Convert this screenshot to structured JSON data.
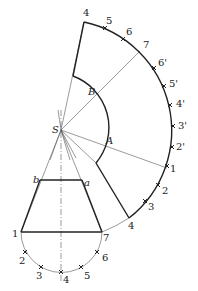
{
  "figure": {
    "apex_label": "S",
    "inner_arc_labels": [
      "A",
      "B"
    ],
    "frustum_top_labels": [
      "b",
      "a"
    ],
    "base_labels": [
      "1",
      "2",
      "3",
      "4",
      "5",
      "6",
      "7"
    ],
    "outer_arc_labels": [
      "1",
      "2",
      "3",
      "4",
      "2'",
      "3'",
      "4'",
      "5'",
      "6'",
      "7",
      "6",
      "5",
      "4"
    ],
    "colors": {
      "line": "#222222",
      "thin_line": "#555555",
      "background": "#ffffff"
    }
  }
}
